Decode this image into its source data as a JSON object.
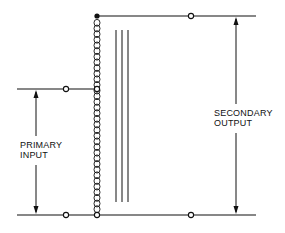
{
  "diagram": {
    "type": "autotransformer-schematic",
    "colors": {
      "line": "#111111",
      "background": "#ffffff"
    },
    "labels": {
      "primary": {
        "line1": "PRIMARY",
        "line2": "INPUT"
      },
      "secondary": {
        "line1": "SECONDARY",
        "line2": "OUTPUT"
      }
    },
    "components": {
      "winding": {
        "name": "coil",
        "turns": 34
      },
      "core": {
        "lines": 3
      },
      "terminals": [
        {
          "name": "secondary-top-terminal",
          "style": "open-circle"
        },
        {
          "name": "primary-top-terminal",
          "style": "open-circle"
        },
        {
          "name": "primary-bottom-terminal",
          "style": "open-circle"
        },
        {
          "name": "secondary-bottom-terminal",
          "style": "open-circle"
        },
        {
          "name": "coil-tap",
          "style": "open-circle"
        },
        {
          "name": "coil-bottom-node",
          "style": "open-circle"
        },
        {
          "name": "coil-top-node",
          "style": "filled-dot"
        }
      ]
    }
  }
}
